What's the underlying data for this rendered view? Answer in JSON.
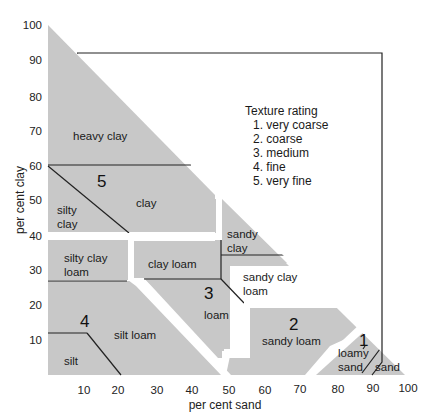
{
  "diagram": {
    "type": "soil-texture-triangle",
    "y_axis": {
      "label": "per cent clay",
      "ticks": [
        "100",
        "90",
        "80",
        "70",
        "60",
        "50",
        "40",
        "30",
        "20",
        "10"
      ]
    },
    "x_axis": {
      "label": "per cent sand",
      "ticks": [
        "10",
        "20",
        "30",
        "40",
        "50",
        "60",
        "70",
        "80",
        "90",
        "100"
      ]
    },
    "legend": {
      "title": "Texture rating",
      "items": [
        "1. very coarse",
        "2. coarse",
        "3. medium",
        "4. fine",
        "5. very fine"
      ]
    },
    "groups": [
      {
        "rating": "5",
        "classes": [
          "heavy clay",
          "clay",
          "silty clay"
        ]
      },
      {
        "rating": "4",
        "classes": [
          "silty clay loam",
          "silt loam",
          "silt"
        ]
      },
      {
        "rating": "3",
        "classes": [
          "clay loam",
          "sandy clay",
          "sandy clay loam",
          "loam"
        ]
      },
      {
        "rating": "2",
        "classes": [
          "sandy loam"
        ]
      },
      {
        "rating": "1",
        "classes": [
          "loamy sand",
          "sand"
        ]
      }
    ],
    "labels": {
      "heavy_clay": "heavy clay",
      "clay": "clay",
      "silty_clay_1": "silty",
      "silty_clay_2": "clay",
      "silty_clay_loam_1": "silty clay",
      "silty_clay_loam_2": "loam",
      "silt_loam": "silt loam",
      "silt": "silt",
      "clay_loam": "clay loam",
      "sandy_clay_1": "sandy",
      "sandy_clay_2": "clay",
      "sandy_clay_loam_1": "sandy clay",
      "sandy_clay_loam_2": "loam",
      "loam": "loam",
      "sandy_loam": "sandy loam",
      "loamy_sand_1": "loamy",
      "loamy_sand_2": "sand",
      "sand": "sand"
    },
    "colors": {
      "zone_fill": "#c8c8c8",
      "line": "#222222",
      "background": "#ffffff"
    }
  }
}
